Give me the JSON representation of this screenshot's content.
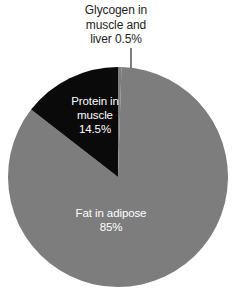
{
  "chart_data": {
    "type": "pie",
    "title": "",
    "subtitle": "",
    "xlabel": "",
    "ylabel": "",
    "grid": false,
    "legend_position": "none",
    "start_angle_deg": 0,
    "direction": "counterclockwise",
    "categories": [
      "Glycogen in muscle and liver",
      "Protein in muscle",
      "Fat in adipose"
    ],
    "values": [
      0.5,
      14.5,
      85
    ],
    "unit": "%",
    "colors": [
      "#7d7d7d",
      "#0a0a0a",
      "#7d7d7d"
    ],
    "slices": [
      {
        "name": "glycogen",
        "label": "Glycogen in\nmuscle and\nliver 0.5%",
        "value": 0.5,
        "value_text": "0.5%",
        "color": "#7d7d7d",
        "label_placement": "outside-callout",
        "label_color": "#1d1d1d"
      },
      {
        "name": "protein",
        "label": "Protein in\nmuscle\n14.5%",
        "value": 14.5,
        "value_text": "14.5%",
        "color": "#0a0a0a",
        "label_placement": "inside",
        "label_color": "#ffffff"
      },
      {
        "name": "fat",
        "label": "Fat in adipose\n85%",
        "value": 85,
        "value_text": "85%",
        "color": "#7d7d7d",
        "label_placement": "inside",
        "label_color": "#ffffff"
      }
    ]
  },
  "figure": {
    "background_color": "#ffffff",
    "pie": {
      "center_x": 118,
      "center_y": 177,
      "radius": 110,
      "fat_color": "#7d7d7d",
      "protein_color": "#0a0a0a",
      "glycogen_color": "#7d7d7d",
      "separator_color": "#ffffff"
    },
    "callout_line": {
      "color": "#3a3a3a",
      "x": 131,
      "y_top": 48,
      "y_bottom": 68
    }
  },
  "labels": {
    "glycogen": "Glycogen in\nmuscle and\nliver 0.5%",
    "protein": "Protein in\nmuscle\n14.5%",
    "fat": "Fat in adipose\n85%"
  }
}
